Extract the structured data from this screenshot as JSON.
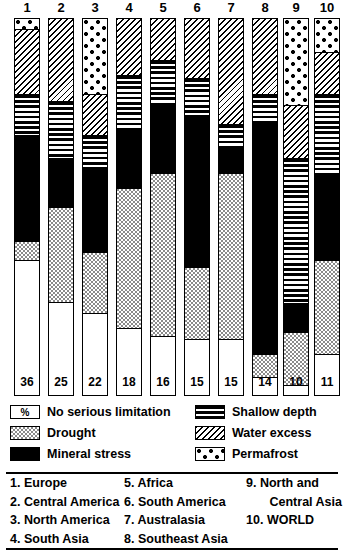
{
  "chart_data": {
    "type": "bar",
    "title": "",
    "subtitle": "",
    "xlabel": "",
    "ylabel": "%",
    "ylim": [
      0,
      100
    ],
    "stacked": true,
    "orientation": "vertical",
    "grid": false,
    "legend_position": "bottom",
    "unit": "%",
    "categories": [
      "1",
      "2",
      "3",
      "4",
      "5",
      "6",
      "7",
      "8",
      "9",
      "10"
    ],
    "category_names": [
      "Europe",
      "Central America",
      "North America",
      "South Asia",
      "Africa",
      "South America",
      "Australasia",
      "Southeast Asia",
      "North and Central Asia",
      "WORLD"
    ],
    "series": [
      {
        "name": "Permafrost",
        "values": [
          3,
          0,
          20,
          0,
          0,
          0,
          0,
          0,
          23,
          9
        ]
      },
      {
        "name": "Water excess",
        "values": [
          17,
          22,
          11,
          15,
          11,
          16,
          28,
          20,
          14,
          11
        ]
      },
      {
        "name": "Shallow depth",
        "values": [
          11,
          15,
          9,
          15,
          12,
          10,
          6,
          8,
          38,
          21
        ]
      },
      {
        "name": "Mineral stress",
        "values": [
          28,
          13,
          22,
          15,
          18,
          40,
          7,
          61,
          8,
          23
        ]
      },
      {
        "name": "Drought",
        "values": [
          5,
          25,
          16,
          37,
          43,
          19,
          44,
          6,
          14,
          25
        ]
      },
      {
        "name": "No serious limitation",
        "values": [
          36,
          25,
          22,
          18,
          16,
          15,
          15,
          14,
          10,
          11
        ]
      }
    ],
    "value_labels": [
      36,
      25,
      22,
      18,
      16,
      15,
      15,
      14,
      10,
      11
    ],
    "value_label_series": "No serious limitation"
  },
  "column_headers": [
    "1",
    "2",
    "3",
    "4",
    "5",
    "6",
    "7",
    "8",
    "9",
    "10"
  ],
  "legend": {
    "percent_symbol": "%",
    "left_items": [
      {
        "label": "No serious limitation",
        "pattern": "none"
      },
      {
        "label": "Drought",
        "pattern": "drought"
      },
      {
        "label": "Mineral stress",
        "pattern": "mineral"
      }
    ],
    "right_items": [
      {
        "label": "Shallow depth",
        "pattern": "shallow"
      },
      {
        "label": "Water excess",
        "pattern": "water"
      },
      {
        "label": "Permafrost",
        "pattern": "permafrost"
      }
    ]
  },
  "regions": {
    "column1": [
      {
        "num": "1.",
        "name": "Europe"
      },
      {
        "num": "2.",
        "name": "Central America"
      },
      {
        "num": "3.",
        "name": "North America"
      },
      {
        "num": "4.",
        "name": "South Asia"
      }
    ],
    "column2": [
      {
        "num": "5.",
        "name": "Africa"
      },
      {
        "num": "6.",
        "name": "South America"
      },
      {
        "num": "7.",
        "name": "Australasia"
      },
      {
        "num": "8.",
        "name": "Southeast Asia"
      }
    ],
    "column3": [
      {
        "num": "9.",
        "name": "North and"
      },
      {
        "num": "",
        "name": "Central Asia"
      },
      {
        "num": "10.",
        "name": "WORLD"
      }
    ]
  }
}
